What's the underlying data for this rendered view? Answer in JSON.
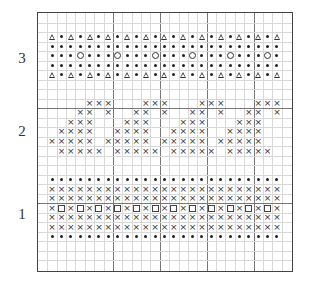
{
  "chart_data": {
    "type": "table",
    "title": "",
    "grid": {
      "cols": 27,
      "rows": 27,
      "major_every": 5,
      "major_cols": [
        8,
        13,
        18,
        23
      ],
      "major_rows": [
        10,
        20
      ]
    },
    "legend": {
      "T": "triangle",
      "d": "dot",
      "o": "circle",
      "x": "cross",
      "s": "square",
      ".": "empty"
    },
    "section_labels": [
      {
        "text": "3",
        "row_center": 4
      },
      {
        "text": "2",
        "row_center": 12
      },
      {
        "text": "1",
        "row_center": 20.5
      }
    ],
    "rows": [
      "...........................",
      "...........................",
      ".TdTdTdTdTdTdTdTdTdTdTdTdT.",
      ".ddddddddddddddddddddddddd.",
      ".dddodddodddodddodddodddod.",
      ".ddddddddddddddddddddddddd.",
      ".TdTdTdTdTdTdTdTdTdTdTdTdT.",
      "...........................",
      "...........................",
      ".....xxx...xxx...xxx...xxx.",
      "....xx.x..xx.x..xx.x..xx.x.",
      "...xxx...xxx...xxx...xxx...",
      "..xxxx..xxxx..xxxx..xxxx...",
      ".xxxxx.xxxxx.xxxxx.xxxxx...",
      "..xxxxx.xxxxx.xxxxx.xxxxx..",
      "...........................",
      "...........................",
      ".ddddddddddddddddddddddddd.",
      ".xxxxxxxxxxxxxxxxxxxxxxxxx.",
      ".xxxxxxxxxxxxxxxxxxxxxxxxx.",
      ".xsxsxsxsxsxsxsxsxsxsxsxsx.",
      ".xxxxxxxxxxxxxxxxxxxxxxxxx.",
      ".xxxxxxxxxxxxxxxxxxxxxxxxx.",
      ".ddddddddddddddddddddddddd.",
      "...........................",
      "...........................",
      "..........................."
    ]
  },
  "labels": {
    "section_3": "3",
    "section_2": "2",
    "section_1": "1"
  }
}
